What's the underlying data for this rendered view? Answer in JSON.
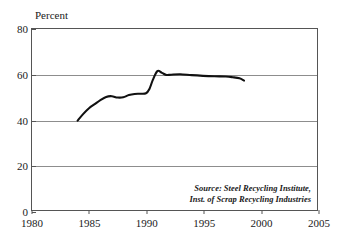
{
  "chart_data": {
    "type": "line",
    "title": "",
    "subtitle": "",
    "xlabel": "",
    "ylabel": "Percent",
    "xlim": [
      1980,
      2005
    ],
    "ylim": [
      0,
      80
    ],
    "grid": true,
    "legend": false,
    "legend_position": "none",
    "xticks": [
      "1980",
      "1985",
      "1990",
      "1995",
      "2000",
      "2005"
    ],
    "yticks": [
      "0",
      "20",
      "40",
      "60",
      "80"
    ],
    "series": [
      {
        "name": "Steel recycling rate",
        "color": "#111111",
        "x": [
          1984.0,
          1984.5,
          1985.0,
          1985.5,
          1986.0,
          1986.5,
          1987.0,
          1987.5,
          1988.0,
          1988.5,
          1989.0,
          1989.5,
          1990.0,
          1990.3,
          1990.6,
          1991.0,
          1991.4,
          1991.8,
          1992.2,
          1993.0,
          1994.0,
          1995.0,
          1996.0,
          1997.0,
          1997.6,
          1998.2,
          1998.6
        ],
        "values": [
          39.5,
          42.5,
          45.0,
          46.8,
          48.6,
          50.0,
          50.3,
          49.7,
          49.8,
          50.8,
          51.3,
          51.4,
          51.6,
          53.5,
          57.5,
          61.4,
          60.6,
          59.7,
          59.8,
          60.0,
          59.6,
          59.3,
          59.1,
          59.0,
          58.7,
          58.2,
          57.2
        ]
      }
    ],
    "annotations": [
      {
        "name": "source-note",
        "lines": [
          "Source: Steel Recycling Institute,",
          "Inst. of Scrap Recycling Industries"
        ]
      }
    ]
  },
  "source_note": {
    "line1": "Source: Steel Recycling Institute,",
    "line2": "Inst. of Scrap Recycling Industries"
  }
}
